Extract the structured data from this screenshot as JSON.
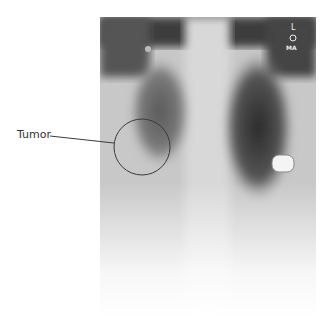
{
  "annotation": {
    "label": "Tumor",
    "marker_color": "#3a3a3a"
  },
  "xray": {
    "side_marker_top": "L",
    "side_marker_bottom": "MA"
  }
}
